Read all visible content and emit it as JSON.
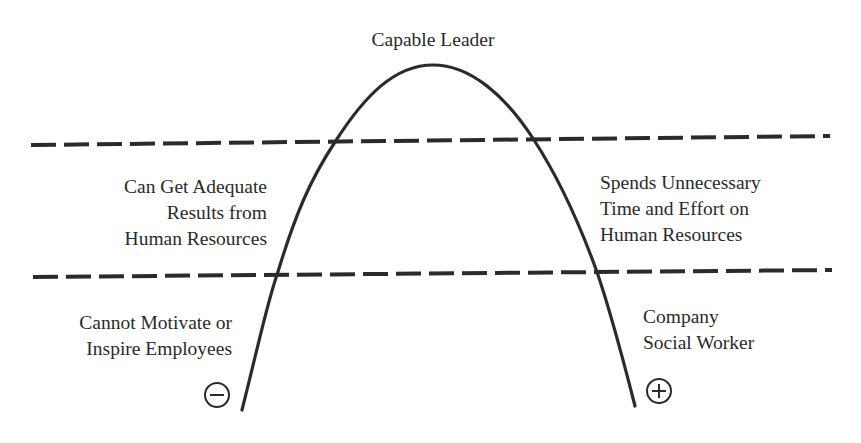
{
  "diagram": {
    "top_label": "Capable Leader",
    "upper_left": [
      "Can Get Adequate",
      "Results from",
      "Human Resources"
    ],
    "upper_right": [
      "Spends Unnecessary",
      "Time and Effort on",
      "Human Resources"
    ],
    "lower_left": [
      "Cannot Motivate or",
      "Inspire Employees"
    ],
    "lower_right": [
      "Company",
      "Social Worker"
    ],
    "negative_symbol": "−",
    "positive_symbol": "+",
    "colors": {
      "line": "#2b2b2b",
      "text": "#2a2a2a",
      "background": "#ffffff"
    }
  }
}
